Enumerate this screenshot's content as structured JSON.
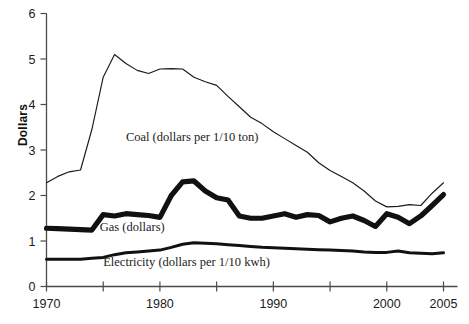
{
  "chart_data": {
    "type": "line",
    "title": "",
    "xlabel": "",
    "ylabel": "Dollars",
    "xlim": [
      1970,
      2005
    ],
    "ylim": [
      0,
      6
    ],
    "grid": false,
    "legend_position": "inline-annotations",
    "y_ticks": [
      "0",
      "1",
      "2",
      "3",
      "4",
      "5",
      "6"
    ],
    "y_tick_values": [
      0,
      1,
      2,
      3,
      4,
      5,
      6
    ],
    "x_tick_values": [
      1970,
      1975,
      1980,
      1985,
      1990,
      1995,
      2000,
      2005
    ],
    "x_tick_labels": [
      "1970",
      "",
      "1980",
      "",
      "1990",
      "",
      "2000",
      "2005"
    ],
    "x_labeled": [
      "1970",
      "1980",
      "1990",
      "2000",
      "2005"
    ],
    "x": [
      1970,
      1971,
      1972,
      1973,
      1974,
      1975,
      1976,
      1977,
      1978,
      1979,
      1980,
      1981,
      1982,
      1983,
      1984,
      1985,
      1986,
      1987,
      1988,
      1989,
      1990,
      1991,
      1992,
      1993,
      1994,
      1995,
      1996,
      1997,
      1998,
      1999,
      2000,
      2001,
      2002,
      2003,
      2004,
      2005
    ],
    "series": [
      {
        "name": "Coal (dollars per 1/10 ton)",
        "label": "Coal (dollars per 1/10 ton)",
        "style": "thin-line",
        "color": "#1a1a1a",
        "values": [
          2.28,
          2.42,
          2.52,
          2.56,
          3.45,
          4.6,
          5.1,
          4.9,
          4.75,
          4.68,
          4.78,
          4.79,
          4.78,
          4.6,
          4.5,
          4.42,
          4.18,
          3.95,
          3.72,
          3.58,
          3.4,
          3.25,
          3.1,
          2.95,
          2.72,
          2.55,
          2.42,
          2.28,
          2.1,
          1.88,
          1.75,
          1.76,
          1.8,
          1.78,
          2.05,
          2.28
        ]
      },
      {
        "name": "Gas (dollars)",
        "label": "Gas (dollars)",
        "style": "thick-line",
        "color": "#111111",
        "values": [
          1.28,
          1.27,
          1.26,
          1.25,
          1.24,
          1.58,
          1.55,
          1.6,
          1.58,
          1.56,
          1.52,
          2.0,
          2.3,
          2.32,
          2.1,
          1.95,
          1.9,
          1.55,
          1.5,
          1.5,
          1.55,
          1.6,
          1.52,
          1.58,
          1.56,
          1.42,
          1.5,
          1.55,
          1.45,
          1.32,
          1.6,
          1.52,
          1.38,
          1.55,
          1.78,
          2.02
        ]
      },
      {
        "name": "Electricity (dollars per 1/10 kwh)",
        "label": "Electricity (dollars per 1/10 kwh)",
        "style": "medium-line",
        "color": "#111111",
        "values": [
          0.6,
          0.6,
          0.6,
          0.6,
          0.62,
          0.64,
          0.7,
          0.74,
          0.76,
          0.78,
          0.8,
          0.86,
          0.93,
          0.96,
          0.95,
          0.94,
          0.92,
          0.9,
          0.88,
          0.86,
          0.85,
          0.84,
          0.83,
          0.82,
          0.81,
          0.8,
          0.79,
          0.78,
          0.76,
          0.75,
          0.75,
          0.78,
          0.74,
          0.73,
          0.72,
          0.74
        ]
      }
    ],
    "annotations": [
      {
        "text": "Coal (dollars per 1/10 ton)",
        "x": 1977.0,
        "y": 3.2
      },
      {
        "text": "Gas (dollars)",
        "x": 1974.7,
        "y": 1.22
      },
      {
        "text": "Electricity (dollars per 1/10 kwh)",
        "x": 1975.0,
        "y": 0.45
      }
    ]
  }
}
